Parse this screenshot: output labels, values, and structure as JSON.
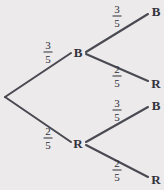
{
  "diagram": {
    "type": "probability-tree",
    "title": "",
    "colors": {
      "background": "#eceaea",
      "line": "#4a4a52",
      "text": "#32323c"
    },
    "root": {
      "label": ""
    },
    "stage1": [
      {
        "id": "b",
        "node_label": "B",
        "probability_numerator": "3",
        "probability_denominator": "5"
      },
      {
        "id": "r",
        "node_label": "R",
        "probability_numerator": "2",
        "probability_denominator": "5"
      }
    ],
    "stage2": [
      {
        "id": "bb",
        "node_label": "B",
        "probability_numerator": "3",
        "probability_denominator": "5"
      },
      {
        "id": "br",
        "node_label": "R",
        "probability_numerator": "2",
        "probability_denominator": "5"
      },
      {
        "id": "rb",
        "node_label": "B",
        "probability_numerator": "3",
        "probability_denominator": "5"
      },
      {
        "id": "rr",
        "node_label": "R",
        "probability_numerator": "2",
        "probability_denominator": "5"
      }
    ]
  }
}
